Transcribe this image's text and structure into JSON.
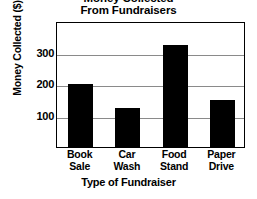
{
  "chart_data": {
    "type": "bar",
    "title": "Money Collected From Fundraisers",
    "title_lines": [
      "Money Collected",
      "From Fundraisers"
    ],
    "xlabel": "Type of Fundraiser",
    "ylabel": "Money Collected ($)",
    "categories": [
      "Book Sale",
      "Car Wash",
      "Food Stand",
      "Paper Drive"
    ],
    "category_lines": [
      [
        "Book",
        "Sale"
      ],
      [
        "Car",
        "Wash"
      ],
      [
        "Food",
        "Stand"
      ],
      [
        "Paper",
        "Drive"
      ]
    ],
    "values": [
      200,
      125,
      325,
      150
    ],
    "ylim": [
      0,
      400
    ],
    "yticks": [
      100,
      200,
      300
    ],
    "ytick_labels": [
      "100",
      "200",
      "300"
    ],
    "grid": true,
    "legend": "none",
    "bar_color": "#000000",
    "gridline_color": "#8a8a8a",
    "frame_color": "#000000",
    "background_color": "#ffffff"
  }
}
